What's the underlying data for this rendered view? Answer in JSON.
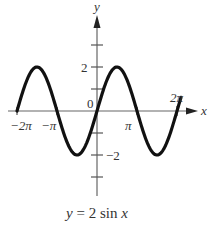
{
  "chart_data": {
    "type": "line",
    "title": "",
    "caption": "y = 2 sin x",
    "caption_parts": {
      "y": "y",
      "eq": " = 2 sin ",
      "x": "x"
    },
    "xlabel": "x",
    "ylabel": "y",
    "function": "2*sin(x)",
    "xlim": [
      -6.283,
      6.6
    ],
    "ylim": [
      -4,
      4
    ],
    "x_ticks": [
      {
        "value": -6.283,
        "label": "−2π"
      },
      {
        "value": -3.1416,
        "label": "−π"
      },
      {
        "value": 3.1416,
        "label": "π"
      },
      {
        "value": 6.283,
        "label": "2π"
      }
    ],
    "y_ticks": [
      {
        "value": 3,
        "label": ""
      },
      {
        "value": 2,
        "label": "2"
      },
      {
        "value": 1,
        "label": ""
      },
      {
        "value": -1,
        "label": ""
      },
      {
        "value": -2,
        "label": "−2"
      },
      {
        "value": -3,
        "label": ""
      }
    ],
    "origin_label": "0",
    "series": [
      {
        "name": "y = 2 sin x",
        "x": [
          -6.283,
          -4.712,
          -3.1416,
          -1.5708,
          0,
          1.5708,
          3.1416,
          4.712,
          6.283
        ],
        "values": [
          0,
          2,
          0,
          -2,
          0,
          2,
          0,
          -2,
          0
        ]
      }
    ],
    "grid": false,
    "legend": "none"
  },
  "colors": {
    "axis": "#555555",
    "curve": "#111111",
    "text": "#333333"
  }
}
